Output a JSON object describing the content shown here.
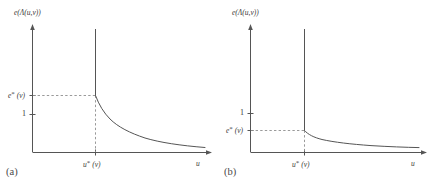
{
  "figure": {
    "caption_a": "(a)",
    "caption_b": "(b)",
    "axis_color": "#555555",
    "curve_color": "#555555",
    "guide_color": "#999999",
    "background": "#ffffff"
  },
  "panel_a": {
    "y_axis_label": "e(Λ(u,v))",
    "x_axis_label": "u",
    "tick_estar": "e*(v)",
    "tick_one": "1",
    "tick_ustar": "u*(v)"
  },
  "panel_b": {
    "y_axis_label": "e(Λ(u,v))",
    "x_axis_label": "u",
    "tick_estar": "e*(v)",
    "tick_one": "1",
    "tick_ustar": "u*(v)"
  },
  "chart_data": [
    {
      "type": "line",
      "panel": "a",
      "title": "",
      "xlabel": "u",
      "ylabel": "e(Λ(u,v))",
      "xlim": [
        0,
        1
      ],
      "ylim": [
        0,
        1
      ],
      "grid": false,
      "legend": null,
      "annotations": [
        {
          "text": "e*(v)",
          "axis": "y",
          "value": 0.58
        },
        {
          "text": "1",
          "axis": "y",
          "value": 0.4
        },
        {
          "text": "u*(v)",
          "axis": "x",
          "value": 0.36
        },
        {
          "text": "(a)",
          "axis": "caption",
          "value": 0
        }
      ],
      "series": [
        {
          "name": "vertical-asymptote",
          "x": [
            0.36,
            0.36
          ],
          "y": [
            1.0,
            0.58
          ]
        },
        {
          "name": "decay-branch",
          "x": [
            0.36,
            0.39,
            0.43,
            0.48,
            0.54,
            0.61,
            0.69,
            0.78,
            0.88,
            1.0
          ],
          "y": [
            0.58,
            0.5,
            0.43,
            0.375,
            0.33,
            0.295,
            0.265,
            0.24,
            0.22,
            0.205
          ]
        }
      ],
      "guides": [
        {
          "name": "estar-dashed-horizontal",
          "from": [
            0.0,
            0.58
          ],
          "to": [
            0.36,
            0.58
          ]
        },
        {
          "name": "ustar-dashed-vertical",
          "from": [
            0.36,
            0.58
          ],
          "to": [
            0.36,
            0.0
          ]
        }
      ]
    },
    {
      "type": "line",
      "panel": "b",
      "title": "",
      "xlabel": "u",
      "ylabel": "e(Λ(u,v))",
      "xlim": [
        0,
        1
      ],
      "ylim": [
        0,
        1
      ],
      "grid": false,
      "legend": null,
      "annotations": [
        {
          "text": "1",
          "axis": "y",
          "value": 0.4
        },
        {
          "text": "e*(v)",
          "axis": "y",
          "value": 0.27
        },
        {
          "text": "u*(v)",
          "axis": "x",
          "value": 0.32
        },
        {
          "text": "(b)",
          "axis": "caption",
          "value": 0
        }
      ],
      "series": [
        {
          "name": "vertical-asymptote",
          "x": [
            0.32,
            0.32
          ],
          "y": [
            1.0,
            0.27
          ]
        },
        {
          "name": "decay-branch",
          "x": [
            0.32,
            0.36,
            0.42,
            0.49,
            0.57,
            0.66,
            0.76,
            0.87,
            1.0
          ],
          "y": [
            0.27,
            0.235,
            0.205,
            0.185,
            0.17,
            0.155,
            0.145,
            0.135,
            0.128
          ]
        }
      ],
      "guides": [
        {
          "name": "estar-dashed-horizontal",
          "from": [
            0.0,
            0.27
          ],
          "to": [
            0.32,
            0.27
          ]
        },
        {
          "name": "ustar-dashed-vertical",
          "from": [
            0.32,
            0.27
          ],
          "to": [
            0.32,
            0.0
          ]
        }
      ]
    }
  ]
}
